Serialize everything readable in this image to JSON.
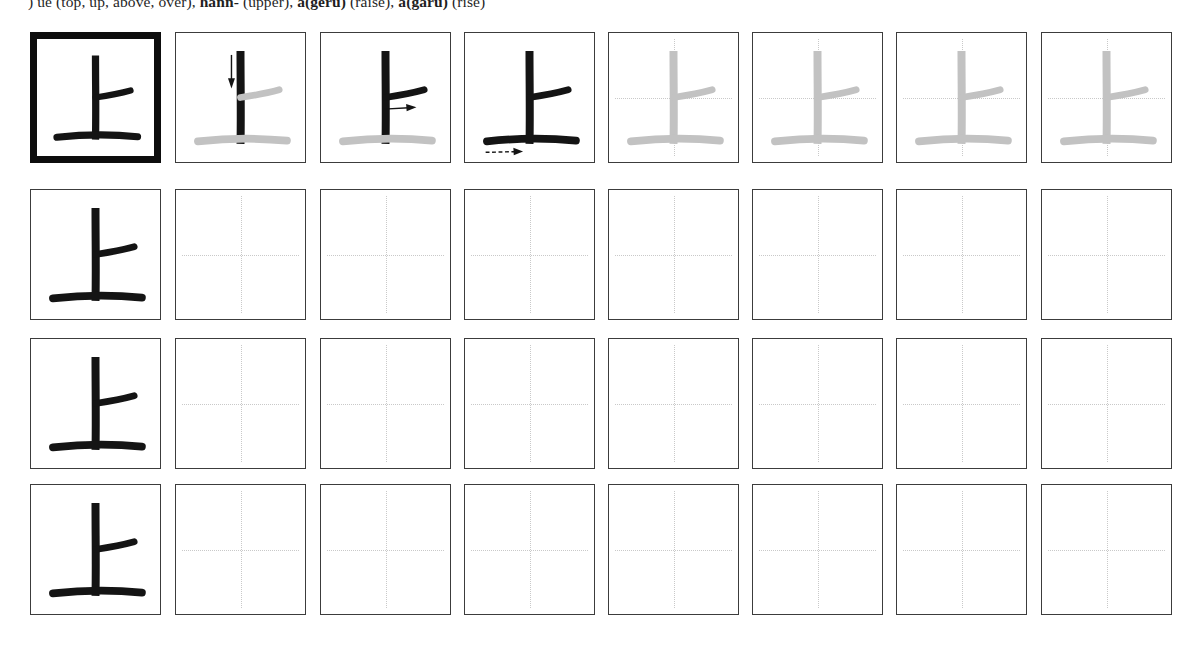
{
  "page": {
    "type": "kanji-stroke-order-practice-worksheet",
    "character": "上",
    "stroke_count": 3
  },
  "header": {
    "gloss_prefix": ") ue (top, up, above, over), ",
    "reading_1": "hann-",
    "gloss_1": " (upper), ",
    "reading_2": "a(geru)",
    "gloss_2": " (raise), ",
    "reading_3": "a(garu)",
    "gloss_3": " (rise)"
  },
  "grid": {
    "columns": 8,
    "rows": 4,
    "row_labels": [
      "stroke-order-row",
      "practice-row-1",
      "practice-row-2",
      "practice-row-3"
    ],
    "cells": [
      [
        {
          "name": "model-character",
          "style": "emphasis",
          "strokes_inked": 3,
          "guides": false,
          "arrow": "none"
        },
        {
          "name": "stroke-step-1",
          "style": "normal",
          "strokes_inked": 1,
          "guides": false,
          "arrow": "down"
        },
        {
          "name": "stroke-step-2",
          "style": "normal",
          "strokes_inked": 2,
          "guides": false,
          "arrow": "right"
        },
        {
          "name": "stroke-step-3",
          "style": "normal",
          "strokes_inked": 3,
          "guides": false,
          "arrow": "right-dashed"
        },
        {
          "name": "trace-cell",
          "style": "normal",
          "strokes_inked": 0,
          "guides": true,
          "arrow": "none"
        },
        {
          "name": "trace-cell",
          "style": "normal",
          "strokes_inked": 0,
          "guides": true,
          "arrow": "none"
        },
        {
          "name": "trace-cell",
          "style": "normal",
          "strokes_inked": 0,
          "guides": true,
          "arrow": "none"
        },
        {
          "name": "trace-cell",
          "style": "normal",
          "strokes_inked": 0,
          "guides": true,
          "arrow": "none"
        }
      ],
      [
        {
          "name": "model-character",
          "style": "normal",
          "strokes_inked": 3,
          "guides": false,
          "arrow": "none"
        },
        {
          "name": "blank-practice-cell",
          "style": "normal",
          "strokes_inked": -1,
          "guides": true,
          "arrow": "none"
        },
        {
          "name": "blank-practice-cell",
          "style": "normal",
          "strokes_inked": -1,
          "guides": true,
          "arrow": "none"
        },
        {
          "name": "blank-practice-cell",
          "style": "normal",
          "strokes_inked": -1,
          "guides": true,
          "arrow": "none"
        },
        {
          "name": "blank-practice-cell",
          "style": "normal",
          "strokes_inked": -1,
          "guides": true,
          "arrow": "none"
        },
        {
          "name": "blank-practice-cell",
          "style": "normal",
          "strokes_inked": -1,
          "guides": true,
          "arrow": "none"
        },
        {
          "name": "blank-practice-cell",
          "style": "normal",
          "strokes_inked": -1,
          "guides": true,
          "arrow": "none"
        },
        {
          "name": "blank-practice-cell",
          "style": "normal",
          "strokes_inked": -1,
          "guides": true,
          "arrow": "none"
        }
      ],
      [
        {
          "name": "model-character",
          "style": "normal",
          "strokes_inked": 3,
          "guides": false,
          "arrow": "none"
        },
        {
          "name": "blank-practice-cell",
          "style": "normal",
          "strokes_inked": -1,
          "guides": true,
          "arrow": "none"
        },
        {
          "name": "blank-practice-cell",
          "style": "normal",
          "strokes_inked": -1,
          "guides": true,
          "arrow": "none"
        },
        {
          "name": "blank-practice-cell",
          "style": "normal",
          "strokes_inked": -1,
          "guides": true,
          "arrow": "none"
        },
        {
          "name": "blank-practice-cell",
          "style": "normal",
          "strokes_inked": -1,
          "guides": true,
          "arrow": "none"
        },
        {
          "name": "blank-practice-cell",
          "style": "normal",
          "strokes_inked": -1,
          "guides": true,
          "arrow": "none"
        },
        {
          "name": "blank-practice-cell",
          "style": "normal",
          "strokes_inked": -1,
          "guides": true,
          "arrow": "none"
        },
        {
          "name": "blank-practice-cell",
          "style": "normal",
          "strokes_inked": -1,
          "guides": true,
          "arrow": "none"
        }
      ],
      [
        {
          "name": "model-character",
          "style": "normal",
          "strokes_inked": 3,
          "guides": false,
          "arrow": "none"
        },
        {
          "name": "blank-practice-cell",
          "style": "normal",
          "strokes_inked": -1,
          "guides": true,
          "arrow": "none"
        },
        {
          "name": "blank-practice-cell",
          "style": "normal",
          "strokes_inked": -1,
          "guides": true,
          "arrow": "none"
        },
        {
          "name": "blank-practice-cell",
          "style": "normal",
          "strokes_inked": -1,
          "guides": true,
          "arrow": "none"
        },
        {
          "name": "blank-practice-cell",
          "style": "normal",
          "strokes_inked": -1,
          "guides": true,
          "arrow": "none"
        },
        {
          "name": "blank-practice-cell",
          "style": "normal",
          "strokes_inked": -1,
          "guides": true,
          "arrow": "none"
        },
        {
          "name": "blank-practice-cell",
          "style": "normal",
          "strokes_inked": -1,
          "guides": true,
          "arrow": "none"
        },
        {
          "name": "blank-practice-cell",
          "style": "normal",
          "strokes_inked": -1,
          "guides": true,
          "arrow": "none"
        }
      ]
    ]
  },
  "colors": {
    "ink": "#141414",
    "ghost": "#c2c2c2",
    "guide": "#c9c9c9",
    "border": "#3c3c3c",
    "emphasis_border": "#0d0d0d",
    "paper": "#ffffff"
  }
}
